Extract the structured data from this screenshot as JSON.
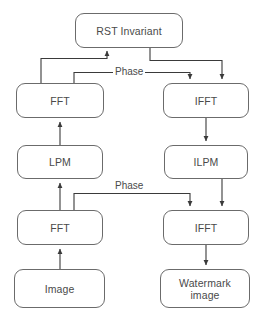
{
  "diagram": {
    "type": "flowchart",
    "colors": {
      "box_border": "#6b6b6b",
      "box_fill": "#ffffff",
      "text": "#4a4a4a",
      "edge": "#3a3a3a",
      "background": "#ffffff"
    },
    "nodes": [
      {
        "id": "rst_invariant",
        "label": "RST Invariant",
        "x": 75,
        "y": 13,
        "w": 108,
        "h": 35
      },
      {
        "id": "fft_top",
        "label": "FFT",
        "x": 16,
        "y": 83,
        "w": 88,
        "h": 35
      },
      {
        "id": "ifft_top",
        "label": "IFFT",
        "x": 163,
        "y": 83,
        "w": 86,
        "h": 35
      },
      {
        "id": "lpm",
        "label": "LPM",
        "x": 17,
        "y": 145,
        "w": 86,
        "h": 34
      },
      {
        "id": "ilpm",
        "label": "ILPM",
        "x": 164,
        "y": 145,
        "w": 84,
        "h": 34
      },
      {
        "id": "fft_bottom",
        "label": "FFT",
        "x": 17,
        "y": 210,
        "w": 86,
        "h": 35
      },
      {
        "id": "ifft_bottom",
        "label": "IFFT",
        "x": 163,
        "y": 210,
        "w": 86,
        "h": 35
      },
      {
        "id": "image",
        "label": "Image",
        "x": 14,
        "y": 269,
        "w": 91,
        "h": 39
      },
      {
        "id": "watermark_image",
        "label": "Watermark\nimage",
        "x": 160,
        "y": 269,
        "w": 90,
        "h": 39
      }
    ],
    "edge_labels": [
      {
        "id": "phase_top",
        "text": "Phase",
        "x": 113,
        "y": 66
      },
      {
        "id": "phase_bottom",
        "text": "Phase",
        "x": 113,
        "y": 180
      }
    ],
    "edges": [
      {
        "id": "fft-top-to-rst",
        "from": "fft_top",
        "to": "rst_invariant",
        "label": ""
      },
      {
        "id": "fft-top-phase-to-ifft-top",
        "from": "fft_top",
        "to": "ifft_top",
        "label": "Phase"
      },
      {
        "id": "rst-to-ifft-top",
        "from": "rst_invariant",
        "to": "ifft_top",
        "label": ""
      },
      {
        "id": "lpm-to-fft-top",
        "from": "lpm",
        "to": "fft_top",
        "label": ""
      },
      {
        "id": "ifft-top-to-ilpm",
        "from": "ifft_top",
        "to": "ilpm",
        "label": ""
      },
      {
        "id": "fft-bottom-to-lpm",
        "from": "fft_bottom",
        "to": "lpm",
        "label": ""
      },
      {
        "id": "fft-bottom-phase-to-ifft-bottom",
        "from": "fft_bottom",
        "to": "ifft_bottom",
        "label": "Phase"
      },
      {
        "id": "ilpm-to-ifft-bottom",
        "from": "ilpm",
        "to": "ifft_bottom",
        "label": ""
      },
      {
        "id": "image-to-fft-bottom",
        "from": "image",
        "to": "fft_bottom",
        "label": ""
      },
      {
        "id": "ifft-bottom-to-watermark",
        "from": "ifft_bottom",
        "to": "watermark_image",
        "label": ""
      }
    ]
  }
}
